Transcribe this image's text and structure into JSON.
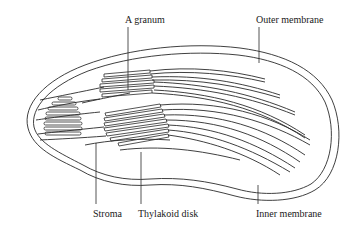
{
  "diagram": {
    "labels": {
      "granum": "A granum",
      "outer_membrane": "Outer membrane",
      "stroma": "Stroma",
      "thylakoid_disk": "Thylakoid disk",
      "inner_membrane": "Inner membrane"
    },
    "colors": {
      "line": "#2a2a2a",
      "background": "#ffffff"
    }
  }
}
